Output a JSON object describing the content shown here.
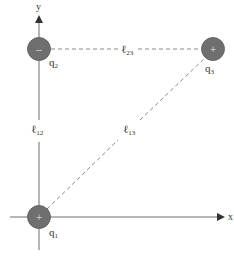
{
  "diagram": {
    "colors": {
      "axis": "#6e6e6e",
      "dashed": "#8a8a8a",
      "charge_fill": "#6f6f6f",
      "charge_stroke": "#5a5a5a",
      "sign": "#cfcfcf",
      "text": "#333333"
    },
    "axes": {
      "x_label": "x",
      "y_label": "y"
    },
    "charges": [
      {
        "id": "q1",
        "label_main": "q",
        "label_sub": "1",
        "sign": "+",
        "cx": 39,
        "cy": 217
      },
      {
        "id": "q2",
        "label_main": "q",
        "label_sub": "2",
        "sign": "−",
        "cx": 39,
        "cy": 49
      },
      {
        "id": "q3",
        "label_main": "q",
        "label_sub": "3",
        "sign": "+",
        "cx": 213,
        "cy": 49
      }
    ],
    "distances": [
      {
        "id": "l12",
        "label_main": "ℓ",
        "label_sub": "12",
        "between": [
          "q1",
          "q2"
        ]
      },
      {
        "id": "l23",
        "label_main": "ℓ",
        "label_sub": "23",
        "between": [
          "q2",
          "q3"
        ]
      },
      {
        "id": "l13",
        "label_main": "ℓ",
        "label_sub": "13",
        "between": [
          "q1",
          "q3"
        ]
      }
    ]
  }
}
